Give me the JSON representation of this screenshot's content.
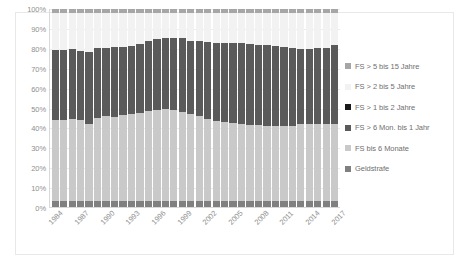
{
  "chart_data": {
    "type": "bar",
    "subtype": "stacked-100-percent",
    "title": "",
    "xlabel": "",
    "ylabel": "",
    "ylim": [
      0,
      100
    ],
    "ytick_labels": [
      "100%",
      "90%",
      "80%",
      "70%",
      "60%",
      "50%",
      "40%",
      "30%",
      "20%",
      "10%",
      "0%"
    ],
    "ytick_values": [
      100,
      90,
      80,
      70,
      60,
      50,
      40,
      30,
      20,
      10,
      0
    ],
    "grid": true,
    "legend_position": "right",
    "x": [
      "1984",
      "1985",
      "1986",
      "1987",
      "1988",
      "1989",
      "1990",
      "1991",
      "1992",
      "1993",
      "1994",
      "1995",
      "1996",
      "1997",
      "1998",
      "1999",
      "2000",
      "2001",
      "2002",
      "2003",
      "2004",
      "2005",
      "2006",
      "2007",
      "2008",
      "2009",
      "2010",
      "2011",
      "2012",
      "2013",
      "2014",
      "2015",
      "2016",
      "2017"
    ],
    "xtick_labels": [
      "1984",
      "1987",
      "1990",
      "1993",
      "1996",
      "1999",
      "2002",
      "2005",
      "2008",
      "2011",
      "2014",
      "2017"
    ],
    "xtick_every": 3,
    "series": [
      {
        "name": "Geldstrafe",
        "color": "#808080",
        "values": [
          3.0,
          3.0,
          3.0,
          3.0,
          3.0,
          3.0,
          3.0,
          3.0,
          3.0,
          3.0,
          3.0,
          3.2,
          3.2,
          3.2,
          3.2,
          3.2,
          3.0,
          3.0,
          3.0,
          3.0,
          3.0,
          3.0,
          3.0,
          3.0,
          3.0,
          3.0,
          3.0,
          3.0,
          3.0,
          3.0,
          3.0,
          3.0,
          3.0,
          3.0
        ]
      },
      {
        "name": "FS bis 6 Monate",
        "color": "#c9c9c9",
        "values": [
          41.0,
          41.0,
          41.5,
          41.0,
          39.0,
          42.0,
          43.0,
          42.5,
          43.5,
          44.0,
          44.5,
          45.5,
          46.0,
          46.5,
          46.0,
          45.0,
          44.0,
          43.0,
          41.5,
          40.5,
          40.0,
          39.5,
          39.0,
          38.5,
          38.5,
          38.0,
          38.0,
          38.0,
          38.0,
          39.0,
          39.0,
          39.0,
          39.0,
          39.0
        ]
      },
      {
        "name": "FS > 6 Mon. bis 1 Jahr",
        "color": "#5a5a5a",
        "values": [
          35.5,
          35.5,
          35.5,
          35.0,
          36.5,
          35.5,
          34.5,
          35.5,
          34.5,
          34.5,
          35.0,
          35.0,
          35.5,
          35.5,
          36.0,
          37.0,
          37.0,
          38.0,
          39.0,
          39.5,
          40.0,
          40.5,
          41.0,
          41.0,
          40.5,
          41.0,
          40.5,
          40.0,
          39.5,
          38.0,
          38.0,
          38.5,
          38.5,
          40.0
        ]
      },
      {
        "name": "FS > 1 bis 2 Jahre",
        "color": "#1a1a1a",
        "values": [
          0.0,
          0.0,
          0.0,
          0.0,
          0.0,
          0.0,
          0.0,
          0.0,
          0.0,
          0.0,
          0.0,
          0.0,
          0.0,
          0.0,
          0.0,
          0.0,
          0.0,
          0.0,
          0.0,
          0.0,
          0.0,
          0.0,
          0.0,
          0.0,
          0.0,
          0.0,
          0.0,
          0.0,
          0.0,
          0.0,
          0.0,
          0.0,
          0.0,
          0.0
        ]
      },
      {
        "name": "FS > 2 bis 5 Jahre",
        "color": "#f2f2f2",
        "values": [
          18.5,
          18.5,
          18.0,
          19.0,
          19.5,
          17.5,
          17.5,
          17.0,
          17.0,
          16.5,
          15.5,
          14.3,
          13.3,
          12.8,
          12.8,
          12.8,
          14.0,
          14.0,
          14.5,
          15.0,
          15.0,
          15.0,
          15.0,
          15.5,
          16.0,
          16.0,
          16.5,
          17.0,
          17.5,
          18.0,
          18.0,
          17.5,
          17.5,
          16.0
        ]
      },
      {
        "name": "FS > 5 bis 15 Jahre",
        "color": "#a6a6a6",
        "values": [
          2.0,
          2.0,
          2.0,
          2.0,
          2.0,
          2.0,
          2.0,
          2.0,
          2.0,
          2.0,
          2.0,
          2.0,
          2.0,
          2.0,
          2.0,
          2.0,
          2.0,
          2.0,
          2.0,
          2.0,
          2.0,
          2.0,
          2.0,
          2.0,
          2.0,
          2.0,
          2.0,
          2.0,
          2.0,
          2.0,
          2.0,
          2.0,
          2.0,
          2.0
        ]
      }
    ],
    "stack_order_bottom_to_top": [
      "Geldstrafe",
      "FS bis 6 Monate",
      "FS > 6 Mon. bis 1 Jahr",
      "FS > 1 bis 2 Jahre",
      "FS > 2 bis 5 Jahre",
      "FS > 5 bis 15 Jahre"
    ]
  },
  "legend": {
    "items": [
      {
        "label": "FS > 5 bis 15 Jahre",
        "color": "#a6a6a6"
      },
      {
        "label": "FS > 2 bis 5 Jahre",
        "color": "#f2f2f2"
      },
      {
        "label": "FS > 1 bis 2 Jahre",
        "color": "#1a1a1a"
      },
      {
        "label": "FS > 6 Mon. bis 1 Jahr",
        "color": "#5a5a5a"
      },
      {
        "label": "FS bis 6 Monate",
        "color": "#c9c9c9"
      },
      {
        "label": "Geldstrafe",
        "color": "#808080"
      }
    ]
  },
  "colors": {
    "plot_background": "#ffffff",
    "frame_border": "#e8e8e8",
    "gridline": "#ececec",
    "axis_line": "#d9d9d9",
    "tick_text": "#8f8f8f",
    "legend_text": "#6f6f6f"
  }
}
